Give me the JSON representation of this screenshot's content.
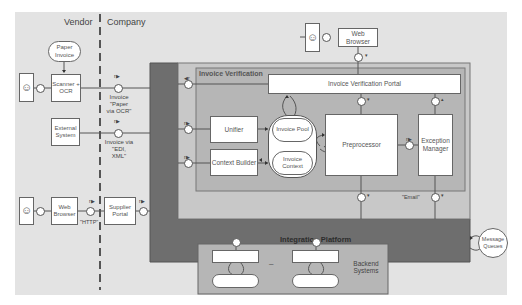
{
  "zones": {
    "vendor": "Vendor",
    "company": "Company"
  },
  "vendor_side": {
    "paper_invoice": "Paper Invoice",
    "scanner": "Scanner + OCR",
    "external_system": "External System",
    "web_browser": "Web Browser",
    "http_label": "\"HTTP\""
  },
  "channels": {
    "paper": "Invoice \"Paper via OCR\"",
    "paper_lines": [
      "Invoice",
      "\"Paper",
      "via OCR\""
    ],
    "edi": "Invoice via \"EDI, XML\"",
    "edi_lines": [
      "Invoice via",
      "\"EDI,",
      "XML\""
    ],
    "supplier_portal": "Supplier Portal"
  },
  "top": {
    "web_browser": "Web Browser"
  },
  "invoice_verification": {
    "title": "Invoice Verification",
    "portal": "Invoice Verification Portal",
    "unifier": "Unifier",
    "context_builder": "Context Builder",
    "invoice_pool": "Invoice Pool",
    "invoice_context": "Invoice Context",
    "preprocessor": "Preprocessor",
    "exception_manager": "Exception Manager"
  },
  "integration": {
    "title": "Integration Platform",
    "email_label": "\"Email\"",
    "message_queues": "Message Queues"
  },
  "backend": {
    "title": "Backend Systems",
    "separator": "–"
  },
  "colors": {
    "background": "#e3e3e3",
    "integration_platform": "#6e6e6e",
    "inner_frame": "#c6c6c6",
    "invoice_verification_area": "#b5b5b5",
    "box_fill": "#ffffff",
    "line": "#555555"
  }
}
